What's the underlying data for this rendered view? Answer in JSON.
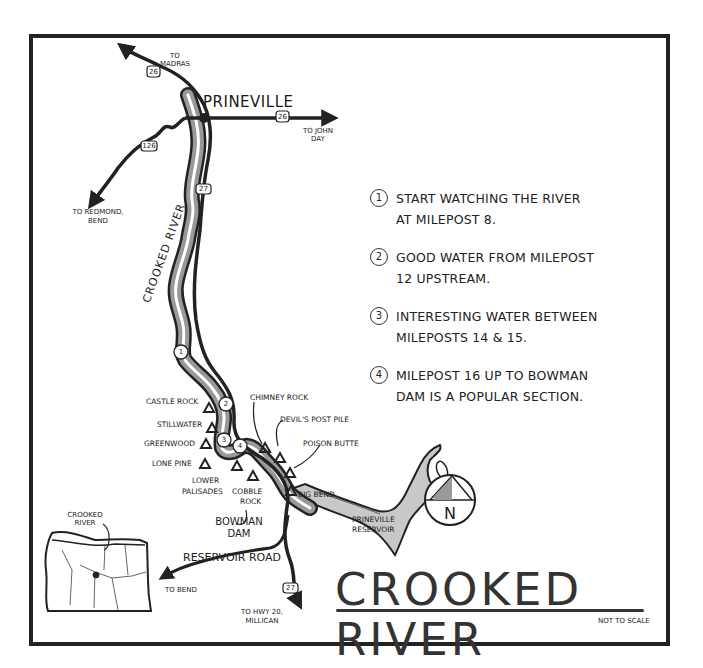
{
  "map": {
    "title": "CROOKED RIVER",
    "scale_note": "NOT TO SCALE",
    "colors": {
      "ink": "#222222",
      "water_fill": "#b8b8b8",
      "reservoir_fill": "#c8c8c8",
      "background": "#ffffff"
    }
  },
  "towns": {
    "prineville": "PRINEVILLE"
  },
  "directions": {
    "madras_1": "TO",
    "madras_2": "MADRAS",
    "john_day_1": "TO JOHN",
    "john_day_2": "DAY",
    "redmond_1": "TO REDMOND,",
    "redmond_2": "BEND",
    "bend": "TO BEND",
    "hwy20_1": "TO HWY 20,",
    "hwy20_2": "MILLICAN"
  },
  "highway_shields": {
    "us26_north": "26",
    "us26_east": "26",
    "or126": "126",
    "or27_north": "27",
    "or27_south": "27"
  },
  "river_label": "CROOKED RIVER",
  "road_label": "RESERVOIR ROAD",
  "river_markers": [
    "1",
    "2",
    "3",
    "4"
  ],
  "campgrounds": {
    "castle_rock": "CASTLE ROCK",
    "stillwater": "STILLWATER",
    "greenwood": "GREENWOOD",
    "lone_pine": "LONE PINE",
    "lower_palisades_1": "LOWER",
    "lower_palisades_2": "PALISADES",
    "cobble_rock_1": "COBBLE",
    "cobble_rock_2": "ROCK",
    "chimney_rock": "CHIMNEY ROCK",
    "devils_post_pile": "DEVIL'S POST PILE",
    "poison_butte": "POISON BUTTE",
    "big_bend": "BIG BEND"
  },
  "features": {
    "bowman_dam_1": "BOWMAN",
    "bowman_dam_2": "DAM",
    "reservoir_1": "PRINEVILLE",
    "reservoir_2": "RESERVOIR"
  },
  "compass": {
    "label": "N"
  },
  "inset": {
    "label_1": "CROOKED",
    "label_2": "RIVER",
    "region": "Oregon"
  },
  "notes": [
    {
      "num": "1",
      "line1": "START WATCHING THE RIVER",
      "line2": "AT MILEPOST 8."
    },
    {
      "num": "2",
      "line1": "GOOD WATER FROM MILEPOST",
      "line2": "12 UPSTREAM."
    },
    {
      "num": "3",
      "line1": "INTERESTING WATER BETWEEN",
      "line2": "MILEPOSTS 14 & 15."
    },
    {
      "num": "4",
      "line1": "MILEPOST 16 UP TO BOWMAN",
      "line2": "DAM IS A POPULAR SECTION."
    }
  ]
}
